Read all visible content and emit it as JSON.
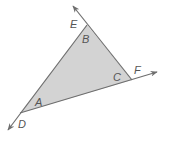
{
  "diagram": {
    "fill_color": "#d3d3d3",
    "stroke_color": "#6e6e6e",
    "vertices": {
      "A": {
        "x": 20,
        "y": 113
      },
      "B": {
        "x": 87,
        "y": 25
      },
      "C": {
        "x": 132,
        "y": 80
      }
    },
    "rays": [
      {
        "from": "C",
        "through": "B",
        "arrow_label": "E",
        "tip": {
          "x": 73,
          "y": 6
        }
      },
      {
        "from": "A",
        "through": "C",
        "arrow_label": "F",
        "tip": {
          "x": 157,
          "y": 72
        }
      },
      {
        "from": "B",
        "through": "A",
        "arrow_label": "D",
        "tip": {
          "x": 8,
          "y": 130
        }
      }
    ],
    "labels": {
      "E": "E",
      "B": "B",
      "C": "C",
      "F": "F",
      "A": "A",
      "D": "D"
    }
  }
}
